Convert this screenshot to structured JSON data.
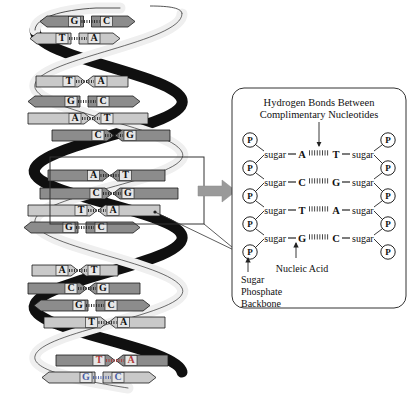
{
  "figure": {
    "background_color": "#ffffff"
  },
  "colors": {
    "ribbon_front": "#e8e8e8",
    "ribbon_back": "#101010",
    "base_block_dark": "#8c8c8c",
    "base_block_light": "#c9c9c9",
    "outline": "#1a1a1a",
    "arrow_gray": "#9a9a9a",
    "accent_red": "#b03a3a",
    "accent_blue": "#4a5fa5"
  },
  "helix": {
    "name": "dna-double-helix",
    "turns": 5,
    "base_pairs": [
      {
        "left": "G",
        "right": "C",
        "direction": "left",
        "shade": "dark",
        "y": 16,
        "x1": 40,
        "x2": 135,
        "tint": null
      },
      {
        "left": "T",
        "right": "A",
        "direction": "left",
        "shade": "light",
        "y": 33,
        "x1": 30,
        "x2": 120,
        "tint": null
      },
      {
        "left": "T",
        "right": "A",
        "direction": "right",
        "shade": "light",
        "y": 76,
        "x1": 36,
        "x2": 128,
        "tint": null
      },
      {
        "left": "G",
        "right": "C",
        "direction": "left",
        "shade": "dark",
        "y": 96,
        "x1": 28,
        "x2": 140,
        "tint": null
      },
      {
        "left": "A",
        "right": "T",
        "direction": "right",
        "shade": "light",
        "y": 113,
        "x1": 28,
        "x2": 148,
        "tint": null
      },
      {
        "left": "C",
        "right": "G",
        "direction": "right",
        "shade": "dark",
        "y": 130,
        "x1": 52,
        "x2": 170,
        "tint": null
      },
      {
        "left": "A",
        "right": "T",
        "direction": "right",
        "shade": "dark",
        "y": 170,
        "x1": 48,
        "x2": 165,
        "tint": null
      },
      {
        "left": "C",
        "right": "G",
        "direction": "right",
        "shade": "dark",
        "y": 188,
        "x1": 40,
        "x2": 178,
        "tint": null
      },
      {
        "left": "T",
        "right": "A",
        "direction": "right",
        "shade": "light",
        "y": 205,
        "x1": 28,
        "x2": 160,
        "tint": null
      },
      {
        "left": "G",
        "right": "C",
        "direction": "left",
        "shade": "dark",
        "y": 222,
        "x1": 24,
        "x2": 140,
        "tint": null
      },
      {
        "left": "A",
        "right": "T",
        "direction": "right",
        "shade": "light",
        "y": 265,
        "x1": 32,
        "x2": 118,
        "tint": null
      },
      {
        "left": "C",
        "right": "G",
        "direction": "right",
        "shade": "dark",
        "y": 283,
        "x1": 28,
        "x2": 140,
        "tint": null
      },
      {
        "left": "G",
        "right": "C",
        "direction": "left",
        "shade": "dark",
        "y": 300,
        "x1": 34,
        "x2": 150,
        "tint": null
      },
      {
        "left": "T",
        "right": "A",
        "direction": "right",
        "shade": "light",
        "y": 317,
        "x1": 44,
        "x2": 165,
        "tint": null
      },
      {
        "left": "T",
        "right": "A",
        "direction": "right",
        "shade": "dark",
        "y": 355,
        "x1": 56,
        "x2": 168,
        "tint": "#b03a3a"
      },
      {
        "left": "G",
        "right": "C",
        "direction": "left",
        "shade": "light",
        "y": 372,
        "x1": 42,
        "x2": 156,
        "tint": "#4a5fa5"
      }
    ]
  },
  "callout": {
    "name": "magnification-callout",
    "box": {
      "x": 50,
      "y": 157,
      "width": 154,
      "height": 67
    },
    "arrow_label": "magnify-arrow"
  },
  "inset": {
    "name": "nucleotide-detail-panel",
    "title_line1": "Hydrogen Bonds Between",
    "title_line2": "Complimentary Nucleotides",
    "sugar_label": "sugar",
    "phosphate_glyph": "P",
    "rows": [
      {
        "left_base": "A",
        "right_base": "T",
        "y": 154
      },
      {
        "left_base": "C",
        "right_base": "G",
        "y": 182
      },
      {
        "left_base": "T",
        "right_base": "A",
        "y": 210
      },
      {
        "left_base": "G",
        "right_base": "C",
        "y": 238
      }
    ],
    "phosphate_y": [
      140,
      168,
      196,
      224,
      252
    ],
    "annotations": [
      {
        "name": "nucleic-acid-label",
        "text": "Nucleic Acid",
        "x": 302,
        "y": 270
      },
      {
        "name": "sugar-phosphate-backbone-label",
        "lines": [
          "Sugar",
          "Phosphate",
          "Backbone"
        ],
        "x": 242,
        "y": 281
      }
    ]
  }
}
